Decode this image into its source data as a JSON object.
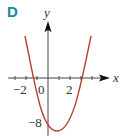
{
  "panel_label": "D",
  "axes": {
    "x_label": "x",
    "y_label": "y"
  },
  "tick_labels": {
    "x_neg2": "−2",
    "x_0": "0",
    "x_2": "2",
    "y_neg8": "−8"
  },
  "colors": {
    "label": "#1a8a9a",
    "curve": "#b5402a",
    "axis": "#333333"
  },
  "curve": {
    "type": "parabola (upward)",
    "y_intercept": -8,
    "approx_roots": [
      -1.4,
      3.2
    ],
    "approx_vertex": [
      0.8,
      -9
    ]
  }
}
